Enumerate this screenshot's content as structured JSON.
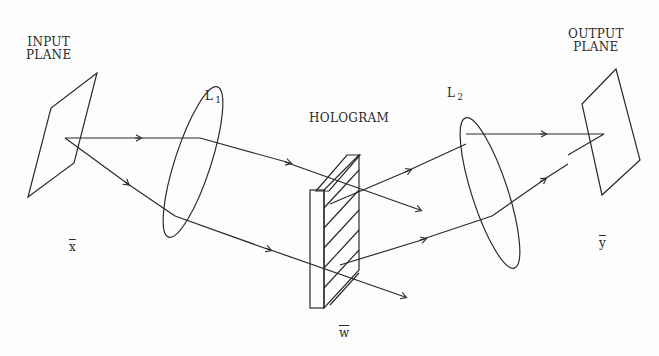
{
  "diagram": {
    "labels": {
      "input_plane": "INPUT\nPLANE",
      "input_plane_line1": "INPUT",
      "input_plane_line2": "PLANE",
      "output_plane_line1": "OUTPUT",
      "output_plane_line2": "PLANE",
      "lens1": "L",
      "lens1_sub": "1",
      "lens2": "L",
      "lens2_sub": "2",
      "hologram": "HOLOGRAM",
      "vec_x": "x",
      "vec_y": "y",
      "vec_w": "w"
    },
    "components": [
      "input plane (x)",
      "lens L1",
      "hologram (w)",
      "lens L2",
      "output plane (y)"
    ],
    "colors": {
      "ink": "#2a2a2a",
      "background": "#fdfdfd"
    }
  }
}
